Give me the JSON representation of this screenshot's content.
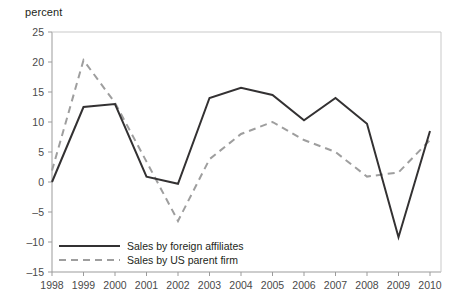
{
  "chart_data": {
    "type": "line",
    "title": "",
    "subtitle": "",
    "xlabel": "",
    "ylabel": "percent",
    "unit_label": "percent",
    "grid": false,
    "legend_position": "bottom-left-inside",
    "x": [
      1998,
      1999,
      2000,
      2001,
      2002,
      2003,
      2004,
      2005,
      2006,
      2007,
      2008,
      2009,
      2010
    ],
    "categories": [
      "1998",
      "1999",
      "2000",
      "2001",
      "2002",
      "2003",
      "2004",
      "2005",
      "2006",
      "2007",
      "2008",
      "2009",
      "2010"
    ],
    "xlim": [
      1998,
      2010
    ],
    "ylim": [
      -15,
      25
    ],
    "yticks": [
      25,
      20,
      15,
      10,
      5,
      0,
      -5,
      -10,
      -15
    ],
    "ytick_labels": [
      "25",
      "20",
      "15",
      "10",
      "5",
      "0",
      "–5",
      "–10",
      "–15"
    ],
    "series": [
      {
        "name": "Sales by foreign affiliates",
        "style": "solid",
        "color": "#333132",
        "values": [
          0.0,
          12.5,
          13.0,
          0.9,
          -0.3,
          14.0,
          15.7,
          14.5,
          10.3,
          14.0,
          9.7,
          -9.2,
          8.5
        ]
      },
      {
        "name": "Sales by US parent firm",
        "style": "dashed",
        "color": "#9e9e9e",
        "values": [
          1.9,
          20.3,
          13.2,
          3.4,
          -6.5,
          3.8,
          8.0,
          10.0,
          7.0,
          5.0,
          0.9,
          1.6,
          7.0
        ]
      }
    ],
    "legend": [
      {
        "label": "Sales by foreign affiliates",
        "style": "solid",
        "color": "#333132"
      },
      {
        "label": "Sales by US parent firm",
        "style": "dashed",
        "color": "#9e9e9e"
      }
    ]
  },
  "colors": {
    "background": "#ffffff",
    "axis": "#9b9b9b",
    "frame": "#c9c9c9",
    "text": "#231f20",
    "tick_text": "#4a4a4a",
    "series_solid": "#333132",
    "series_dashed": "#9e9e9e"
  }
}
